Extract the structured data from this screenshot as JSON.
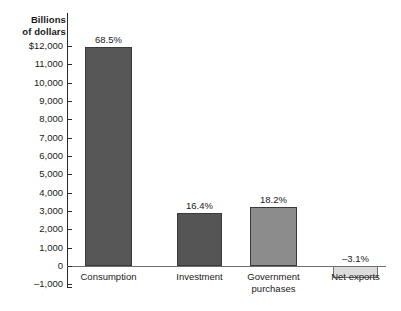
{
  "chart_data": {
    "type": "bar",
    "title": "",
    "subtitle": "",
    "xlabel": "",
    "ylabel": "Billions\nof dollars",
    "ylim": [
      -1000,
      12000
    ],
    "grid": false,
    "legend": null,
    "categories": [
      "Consumption",
      "Investment",
      "Government\npurchases",
      "Net exports"
    ],
    "values": [
      11900,
      2850,
      3170,
      -540
    ],
    "data_labels": [
      "68.5%",
      "16.4%",
      "18.2%",
      "–3.1%"
    ],
    "ytick_labels": [
      "$12,000",
      "11,000",
      "10,000",
      "9,000",
      "8,000",
      "7,000",
      "6,000",
      "5,000",
      "4,000",
      "3,000",
      "2,000",
      "1,000",
      "0",
      "–1,000"
    ],
    "ytick_values": [
      12000,
      11000,
      10000,
      9000,
      8000,
      7000,
      6000,
      5000,
      4000,
      3000,
      2000,
      1000,
      0,
      -1000
    ],
    "bar_colors": [
      "#575757",
      "#555555",
      "#8c8c8c",
      "#dcdcdc"
    ],
    "axis_color": "#2b2b2b",
    "zero_line_color": "#6d6d6d",
    "background": "#ffffff"
  },
  "geometry": {
    "bars": [
      {
        "left": 85,
        "width": 47,
        "top": 47,
        "height": 219,
        "label_left": 70,
        "label_top": 34,
        "label_width": 77,
        "cat_left": 62,
        "cat_top": 271,
        "cat_width": 93
      },
      {
        "left": 177,
        "width": 45,
        "top": 213,
        "height": 53,
        "label_left": 162,
        "label_top": 200,
        "label_width": 75,
        "cat_left": 155,
        "cat_top": 271,
        "cat_width": 89
      },
      {
        "left": 250,
        "width": 47,
        "top": 207,
        "height": 59,
        "label_left": 235,
        "label_top": 194,
        "label_width": 77,
        "cat_left": 228,
        "cat_top": 271,
        "cat_width": 91
      },
      {
        "left": 333,
        "width": 45,
        "top": 266,
        "height": 12,
        "label_left": 318,
        "label_top": 253,
        "label_width": 75,
        "cat_left": 311,
        "cat_top": 271,
        "cat_width": 89
      }
    ],
    "y_top": 46,
    "y_zero": 266,
    "px_per_unit": 0.018333
  }
}
